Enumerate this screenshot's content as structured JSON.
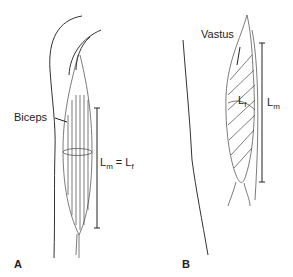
{
  "panels": [
    {
      "letter": "A",
      "muscle": "Biceps",
      "length_main": "L",
      "length_main_sub": "m",
      "eq": " = L",
      "eq_sub": "f"
    },
    {
      "letter": "B",
      "muscle": "Vastus",
      "fiber": "L",
      "fiber_sub": "f",
      "length_main": "L",
      "length_main_sub": "m"
    }
  ],
  "colors": {
    "line": "#222222",
    "background": "#ffffff"
  }
}
